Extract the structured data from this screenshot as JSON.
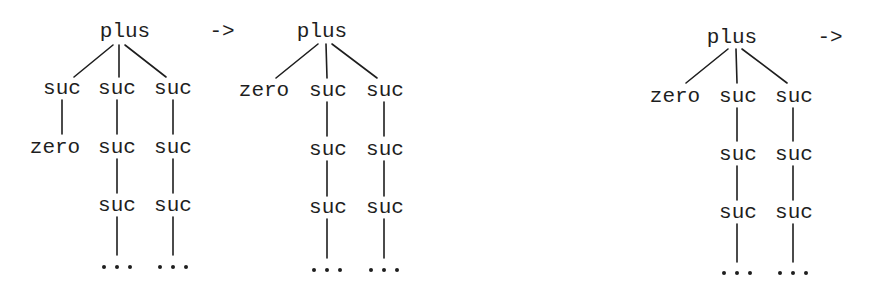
{
  "diagram": {
    "title": "",
    "background": "#ffffff",
    "ink_color": "#1e1e1e",
    "arrow_symbol": "->",
    "ellipsis_symbol": "...",
    "trees": [
      {
        "root": "plus",
        "arrow": "->",
        "children": [
          {
            "chain": [
              "suc",
              "zero"
            ]
          },
          {
            "chain": [
              "suc",
              "suc",
              "suc",
              "..."
            ]
          },
          {
            "chain": [
              "suc",
              "suc",
              "suc",
              "..."
            ]
          }
        ]
      },
      {
        "root": "plus",
        "arrow": "",
        "children": [
          {
            "chain": [
              "zero"
            ]
          },
          {
            "chain": [
              "suc",
              "suc",
              "suc",
              "..."
            ]
          },
          {
            "chain": [
              "suc",
              "suc",
              "suc",
              "..."
            ]
          }
        ]
      },
      {
        "root": "plus",
        "arrow": "->",
        "children": [
          {
            "chain": [
              "zero"
            ]
          },
          {
            "chain": [
              "suc",
              "suc",
              "suc",
              "..."
            ]
          },
          {
            "chain": [
              "suc",
              "suc",
              "suc",
              "..."
            ]
          }
        ]
      }
    ]
  },
  "labels": {
    "t1": {
      "root": "plus",
      "arrow": "->",
      "c1r1": "suc",
      "c1r2": "zero",
      "c2r1": "suc",
      "c2r2": "suc",
      "c2r3": "suc",
      "c3r1": "suc",
      "c3r2": "suc",
      "c3r3": "suc"
    },
    "t2": {
      "root": "plus",
      "c1r1": "zero",
      "c2r1": "suc",
      "c2r2": "suc",
      "c2r3": "suc",
      "c3r1": "suc",
      "c3r2": "suc",
      "c3r3": "suc"
    },
    "t3": {
      "root": "plus",
      "arrow": "->",
      "c1r1": "zero",
      "c2r1": "suc",
      "c2r2": "suc",
      "c2r3": "suc",
      "c3r1": "suc",
      "c3r2": "suc",
      "c3r3": "suc"
    }
  }
}
